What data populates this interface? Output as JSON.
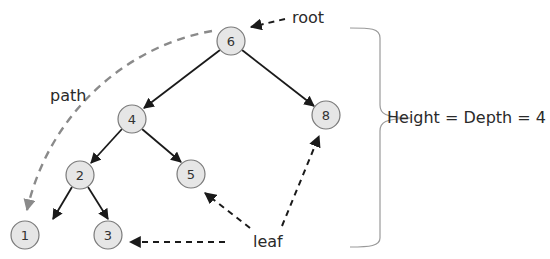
{
  "diagram": {
    "type": "binary-tree",
    "nodes": [
      {
        "id": "6",
        "label": "6",
        "x": 231,
        "y": 41
      },
      {
        "id": "4",
        "label": "4",
        "x": 132,
        "y": 119
      },
      {
        "id": "8",
        "label": "8",
        "x": 326,
        "y": 115
      },
      {
        "id": "2",
        "label": "2",
        "x": 80,
        "y": 175
      },
      {
        "id": "5",
        "label": "5",
        "x": 191,
        "y": 174
      },
      {
        "id": "1",
        "label": "1",
        "x": 25,
        "y": 235
      },
      {
        "id": "3",
        "label": "3",
        "x": 108,
        "y": 235
      }
    ],
    "edges": [
      {
        "from": "6",
        "to": "4"
      },
      {
        "from": "6",
        "to": "8"
      },
      {
        "from": "4",
        "to": "2"
      },
      {
        "from": "4",
        "to": "5"
      },
      {
        "from": "2",
        "to": "1"
      },
      {
        "from": "2",
        "to": "3"
      }
    ],
    "annotations": {
      "root": "root",
      "path": "path",
      "leaf": "leaf",
      "height": "Height = Depth = 4"
    },
    "colors": {
      "node_fill": "#e6e6e6",
      "node_stroke": "#7a7a7a",
      "edge": "#1a1a1a",
      "path_arc": "#8a8a8a",
      "brace": "#9a9a9a"
    }
  }
}
